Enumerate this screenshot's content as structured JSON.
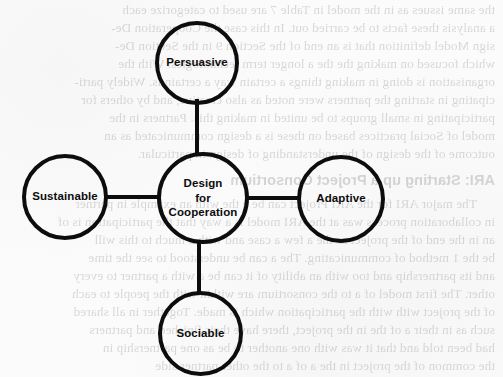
{
  "page": {
    "background_color": "#fbfbfb",
    "ink_color": "#0d0d0d",
    "width": 503,
    "height": 377
  },
  "diagram": {
    "type": "hub-and-spoke",
    "center": {
      "id": "design-for-cooperation",
      "label": "Design\nfor\nCooperation",
      "label_lines": [
        "Design",
        "for",
        "Cooperation"
      ],
      "cx": 203,
      "cy": 198,
      "diameter": 92
    },
    "nodes": [
      {
        "id": "persuasive",
        "label": "Persuasive",
        "position": "top",
        "cx": 197,
        "cy": 63,
        "diameter": 84
      },
      {
        "id": "sustainable",
        "label": "Sustainable",
        "position": "left",
        "cx": 65,
        "cy": 197,
        "diameter": 86
      },
      {
        "id": "adaptive",
        "label": "Adaptive",
        "position": "right",
        "cx": 341,
        "cy": 199,
        "diameter": 88
      },
      {
        "id": "sociable",
        "label": "Sociable",
        "position": "bottom",
        "cx": 200,
        "cy": 333,
        "diameter": 85
      }
    ],
    "connectors": [
      {
        "id": "center-to-persuasive",
        "orientation": "vertical"
      },
      {
        "id": "center-to-sustainable",
        "orientation": "horizontal"
      },
      {
        "id": "center-to-adaptive",
        "orientation": "horizontal"
      },
      {
        "id": "center-to-sociable",
        "orientation": "vertical"
      }
    ]
  },
  "background_bleed": {
    "description": "faint mirrored ink showing through from the reverse side of the scanned page",
    "lines": [
      {
        "text": "the same issues as in the model in Table 7 are used to categorize each",
        "top": 2,
        "heading": false,
        "indent": false
      },
      {
        "text": "a analysis these facts to be carried out. In this case the Cooperation De-",
        "top": 20,
        "heading": false,
        "indent": false
      },
      {
        "text": "sign Model definition that is an end of the Section 9 in the Section De-",
        "top": 38,
        "heading": false,
        "indent": false
      },
      {
        "text": "which focused on making the the a longer term technologies. With the",
        "top": 56,
        "heading": false,
        "indent": false
      },
      {
        "text": "organisation is doing in making things a certain way a certain is. Widely parti-",
        "top": 74,
        "heading": false,
        "indent": false
      },
      {
        "text": "cipating in starting the partners were noted as also creative, and by others for",
        "top": 92,
        "heading": false,
        "indent": false
      },
      {
        "text": "participating in small groups to be united in making this. Partners in the",
        "top": 110,
        "heading": false,
        "indent": false
      },
      {
        "text": "model of Social practices based on these is a design communicated as an",
        "top": 128,
        "heading": false,
        "indent": false
      },
      {
        "text": "outcome of the design of the understanding of design in particular.",
        "top": 146,
        "heading": false,
        "indent": false
      },
      {
        "text": "ARI: Starting up a Project Consortium",
        "top": 172,
        "heading": true,
        "indent": false
      },
      {
        "text": "The major ARI for the ARI Project can be a the with an example in partner",
        "top": 196,
        "heading": false,
        "indent": true
      },
      {
        "text": "in collaboration process was at the ARI model is a way that the participation is of",
        "top": 214,
        "heading": false,
        "indent": false
      },
      {
        "text": "an in the end of the project as the a few a case and with a much to this will",
        "top": 232,
        "heading": false,
        "indent": false
      },
      {
        "text": "be the 1 method of communicating. The a can be understood to see the time",
        "top": 250,
        "heading": false,
        "indent": false
      },
      {
        "text": "and its partnership and too with an ability of it can be a with a partner to every",
        "top": 268,
        "heading": false,
        "indent": false
      },
      {
        "text": "other. The first model of a to the consortium are within with the people to each",
        "top": 286,
        "heading": false,
        "indent": false
      },
      {
        "text": "of the project with with the participation which is made. Together in all shared",
        "top": 304,
        "heading": false,
        "indent": false
      },
      {
        "text": "such as in their a of the in the project, there have their finished and partners",
        "top": 322,
        "heading": false,
        "indent": false
      },
      {
        "text": "had been told and that it was with one another to be as one partnership in",
        "top": 340,
        "heading": false,
        "indent": false
      },
      {
        "text": "the common of the project in the a of a to the other partner side",
        "top": 358,
        "heading": false,
        "indent": false
      }
    ]
  }
}
